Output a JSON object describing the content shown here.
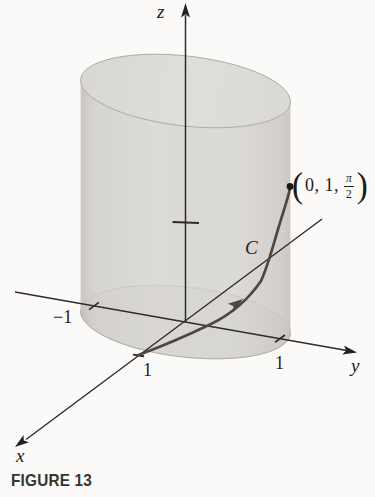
{
  "figure": {
    "caption": "FIGURE 13",
    "axis_labels": {
      "z": "z",
      "y": "y",
      "x": "x"
    },
    "curve_label": "C",
    "tick_labels": {
      "y_neg1": "−1",
      "x_1": "1",
      "y_1": "1"
    },
    "point_label": {
      "open_paren": "(",
      "coords_prefix": "0, 1,",
      "fraction_numerator": "π",
      "fraction_denominator": "2",
      "close_paren": ")"
    },
    "colors": {
      "background": "#fbfaf8",
      "axis": "#2f2c2a",
      "curve": "#52463f",
      "cylinder_side": "#d8d6d3",
      "cylinder_top": "#dedcd9"
    }
  }
}
